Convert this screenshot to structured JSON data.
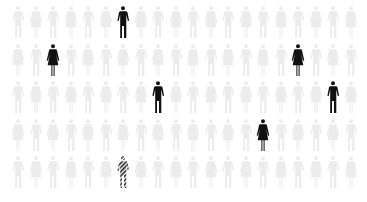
{
  "chart_data": {
    "type": "pictogram",
    "title": "",
    "rows": 5,
    "columns": 20,
    "total_icons": 100,
    "highlighted": [
      {
        "row": 0,
        "col": 6,
        "figure": "man",
        "style": "solid"
      },
      {
        "row": 1,
        "col": 2,
        "figure": "woman",
        "style": "solid"
      },
      {
        "row": 1,
        "col": 16,
        "figure": "woman",
        "style": "solid"
      },
      {
        "row": 2,
        "col": 8,
        "figure": "man",
        "style": "solid"
      },
      {
        "row": 2,
        "col": 18,
        "figure": "man",
        "style": "solid"
      },
      {
        "row": 3,
        "col": 14,
        "figure": "woman",
        "style": "solid"
      },
      {
        "row": 4,
        "col": 6,
        "figure": "man",
        "style": "hatched"
      }
    ],
    "counts": {
      "solid": 6,
      "hatched": 1,
      "faded": 93
    },
    "legend": []
  },
  "colors": {
    "faded": "#ececec",
    "solid": "#111111",
    "hatch": "#222222",
    "background": "#ffffff"
  },
  "layout": {
    "x0": 10,
    "dx": 17.5,
    "y0": 5,
    "dy": 37.5
  }
}
